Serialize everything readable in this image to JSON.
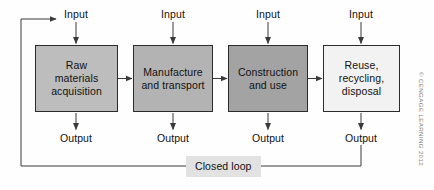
{
  "diagram": {
    "stages": [
      {
        "id": "raw-materials-acquisition",
        "label": "Raw\nmaterials\nacquisition",
        "lines": [
          "Raw",
          "materials",
          "acquisition"
        ],
        "fill": "#bdbdbd",
        "x": 35,
        "y": 45,
        "w": 83,
        "h": 67
      },
      {
        "id": "manufacture-and-transport",
        "label": "Manufacture\nand transport",
        "lines": [
          "Manufacture",
          "and transport"
        ],
        "fill": "#b3b3b3",
        "x": 133,
        "y": 45,
        "w": 80,
        "h": 67
      },
      {
        "id": "construction-and-use",
        "label": "Construction\nand use",
        "lines": [
          "Construction",
          "and use"
        ],
        "fill": "#a3a3a3",
        "x": 228,
        "y": 45,
        "w": 80,
        "h": 67
      },
      {
        "id": "reuse-recycling-disposal",
        "label": "Reuse,\nrecycling,\ndisposal",
        "lines": [
          "Reuse,",
          "recycling,",
          "disposal"
        ],
        "fill": "#f2f2f2",
        "x": 323,
        "y": 45,
        "w": 77,
        "h": 67
      }
    ],
    "inputs": [
      {
        "label": "Input",
        "x": 76,
        "y": 8
      },
      {
        "label": "Input",
        "x": 173,
        "y": 8
      },
      {
        "label": "Input",
        "x": 268,
        "y": 8
      },
      {
        "label": "Input",
        "x": 361,
        "y": 8
      }
    ],
    "outputs": [
      {
        "label": "Output",
        "x": 76,
        "y": 132
      },
      {
        "label": "Output",
        "x": 173,
        "y": 132
      },
      {
        "label": "Output",
        "x": 268,
        "y": 132
      },
      {
        "label": "Output",
        "x": 361,
        "y": 132
      }
    ],
    "closed_loop": {
      "label": "Closed loop",
      "x": 186,
      "y": 156
    },
    "credit": "© CENGAGE LEARNING 2012",
    "colors": {
      "line": "#3a3a3a",
      "text": "#111111",
      "loop_label_bg": "#e2e2e2",
      "background": "#fefefe"
    }
  }
}
